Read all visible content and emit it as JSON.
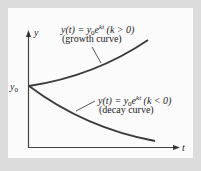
{
  "diagram": {
    "axes": {
      "y_label": "y",
      "x_label": "t",
      "origin_label": "y0"
    },
    "growth": {
      "formula_lhs": "y(t) = y",
      "formula_sub": "0",
      "formula_e": "e",
      "formula_exp": "kt",
      "condition": "(k > 0)",
      "caption": "(growth curve)"
    },
    "decay": {
      "formula_lhs": "y(t) = y",
      "formula_sub": "0",
      "formula_e": "e",
      "formula_exp": "kt",
      "condition": "(k < 0)",
      "caption": "(decay curve)"
    },
    "colors": {
      "background": "#dcdcdc",
      "panel": "#fbfbfb",
      "ink": "#333333"
    }
  }
}
